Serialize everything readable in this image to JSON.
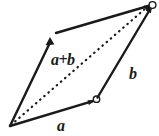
{
  "figure": {
    "background_color": "#ffffff",
    "stroke_color": "#1a1a1a",
    "width": 159,
    "height": 136,
    "labels": {
      "sum": "a+b",
      "vector_a": "a",
      "vector_b": "b"
    },
    "points": {
      "origin": [
        10,
        126
      ],
      "a_tip": [
        96,
        100
      ],
      "b_tip": [
        50,
        38
      ],
      "sum_tip": [
        152,
        5
      ],
      "top_edge_start": [
        56,
        33
      ]
    },
    "markers": {
      "circle_at_a_tip": true,
      "circle_at_sum_tip": true,
      "arrowhead_on_a": true,
      "arrowhead_on_b": true,
      "arrowhead_on_sum": true
    },
    "dashed_diagonal": true
  }
}
